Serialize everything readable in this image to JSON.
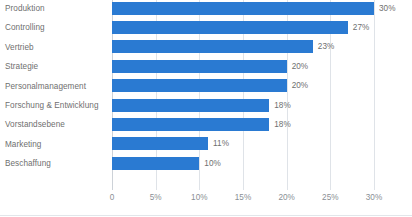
{
  "chart_data": {
    "type": "bar",
    "orientation": "horizontal",
    "title": "",
    "subtitle": "",
    "xlabel": "",
    "ylabel": "",
    "categories": [
      "Produktion",
      "Controlling",
      "Vertrieb",
      "Strategie",
      "Personalmanagement",
      "Forschung & Entwicklung",
      "Vorstandsebene",
      "Marketing",
      "Beschaffung"
    ],
    "values": [
      30,
      27,
      23,
      20,
      20,
      18,
      18,
      11,
      10
    ],
    "data_labels": [
      "30%",
      "27%",
      "23%",
      "20%",
      "20%",
      "18%",
      "18%",
      "11%",
      "10%"
    ],
    "xlim": [
      0,
      30
    ],
    "xticks": [
      0,
      5,
      10,
      15,
      20,
      25,
      30
    ],
    "xtick_labels": [
      "0",
      "5%",
      "10%",
      "15%",
      "20%",
      "25%",
      "30%"
    ],
    "grid": true,
    "grid_axis": "x",
    "legend": false,
    "legend_position": "none",
    "bar_color": "#2a7ad2",
    "label_color": "#6f6f6f",
    "tick_color": "#8a8f95",
    "gridline_color": "#dfe3e8",
    "background_color": "#ffffff"
  }
}
